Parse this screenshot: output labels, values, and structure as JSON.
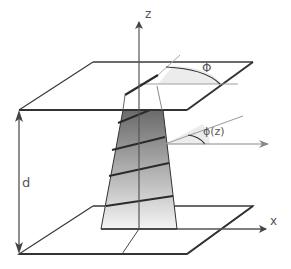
{
  "diagram": {
    "labels": {
      "z_axis": "z",
      "x_axis": "x",
      "separation": "d",
      "total_twist_angle": "Φ",
      "local_twist_angle": "ϕ(z)"
    },
    "colors": {
      "stroke_dark": "#333333",
      "stroke_light": "#999999",
      "column_gradient_top": "#6e6e6e",
      "column_gradient_bottom": "#f2f2f2",
      "angle_fill": "#ececec",
      "label": "#555555"
    }
  }
}
